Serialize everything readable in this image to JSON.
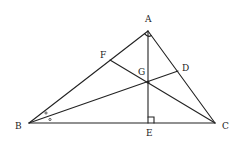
{
  "diagram": {
    "colors": {
      "stroke": "#222222",
      "background": "#ffffff"
    },
    "points": {
      "A": {
        "label": "A",
        "x": 148,
        "y": 31
      },
      "B": {
        "label": "B",
        "x": 29,
        "y": 123
      },
      "C": {
        "label": "C",
        "x": 215,
        "y": 123
      },
      "D": {
        "label": "D",
        "x": 178,
        "y": 71
      },
      "E": {
        "label": "E",
        "x": 148,
        "y": 123
      },
      "F": {
        "label": "F",
        "x": 110,
        "y": 60
      },
      "G": {
        "label": "G",
        "x": 148,
        "y": 82
      }
    },
    "segments": [
      "AB",
      "AC",
      "BC",
      "AE",
      "BD",
      "CF"
    ],
    "marks": {
      "right_angle_A": "angle BAC = 90°",
      "right_angle_E": "angle AEC = 90°",
      "equal_angles_B": "angle ABD = angle DBC (small circles)"
    }
  }
}
